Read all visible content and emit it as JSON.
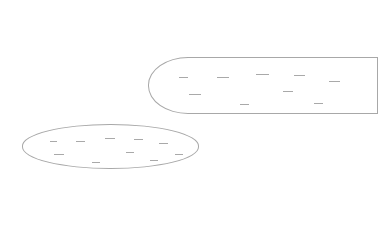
{
  "canvas": {
    "width": 345,
    "height": 226,
    "background": "#ffffff"
  },
  "shapes": [
    {
      "id": "upper-shape",
      "kind": "rounded-pill",
      "outline_color": "#a8a8a8",
      "clipped_right": true,
      "labels": [
        {
          "x": 179,
          "y": 77,
          "w": 9,
          "text": ""
        },
        {
          "x": 217,
          "y": 77,
          "w": 12,
          "text": ""
        },
        {
          "x": 256,
          "y": 74,
          "w": 13,
          "text": ""
        },
        {
          "x": 294,
          "y": 75,
          "w": 11,
          "text": ""
        },
        {
          "x": 329,
          "y": 81,
          "w": 11,
          "text": ""
        },
        {
          "x": 189,
          "y": 94,
          "w": 12,
          "text": ""
        },
        {
          "x": 283,
          "y": 91,
          "w": 10,
          "text": ""
        },
        {
          "x": 240,
          "y": 104,
          "w": 9,
          "text": ""
        },
        {
          "x": 314,
          "y": 103,
          "w": 9,
          "text": ""
        }
      ]
    },
    {
      "id": "lower-shape",
      "kind": "ellipse",
      "outline_color": "#a8a8a8",
      "clipped_right": false,
      "labels": [
        {
          "x": 50,
          "y": 141,
          "w": 7,
          "text": ""
        },
        {
          "x": 76,
          "y": 141,
          "w": 9,
          "text": ""
        },
        {
          "x": 105,
          "y": 138,
          "w": 10,
          "text": ""
        },
        {
          "x": 134,
          "y": 139,
          "w": 9,
          "text": ""
        },
        {
          "x": 159,
          "y": 143,
          "w": 9,
          "text": ""
        },
        {
          "x": 54,
          "y": 154,
          "w": 10,
          "text": ""
        },
        {
          "x": 126,
          "y": 152,
          "w": 8,
          "text": ""
        },
        {
          "x": 92,
          "y": 162,
          "w": 8,
          "text": ""
        },
        {
          "x": 150,
          "y": 160,
          "w": 8,
          "text": ""
        },
        {
          "x": 175,
          "y": 154,
          "w": 8,
          "text": ""
        }
      ]
    }
  ]
}
